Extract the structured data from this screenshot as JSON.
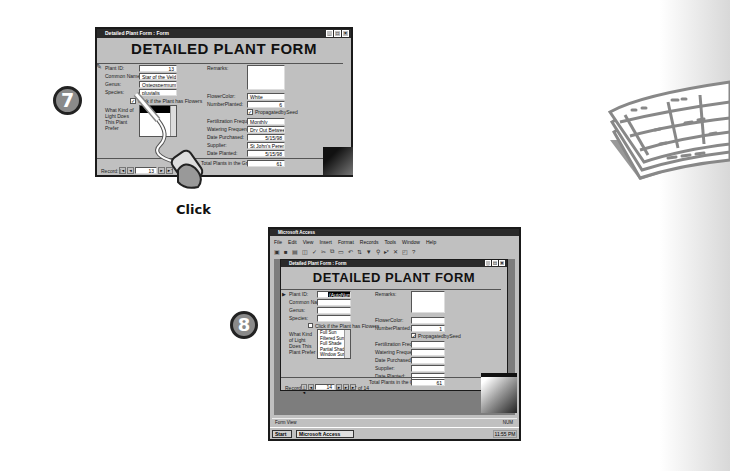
{
  "step7": {
    "badge": "7",
    "window": {
      "title": "Detailed Plant Form : Form",
      "form_title": "DETAILED PLANT FORM",
      "fields": {
        "plant_id": {
          "label": "Plant ID:",
          "value": "13"
        },
        "common_name": {
          "label": "Common Name:",
          "value": "Star of the Veldt"
        },
        "genus": {
          "label": "Genus:",
          "value": "Osteospermum"
        },
        "species": {
          "label": "Species:",
          "value": "pluvialis"
        },
        "flowers_checkbox": {
          "label": "Click if the Plant has Flowers",
          "checked": "✓"
        },
        "light": {
          "label": "What Kind of Light Does This Plant Prefer"
        },
        "remarks": {
          "label": "Remarks:",
          "value": ""
        },
        "flower_color": {
          "label": "FlowerColor:",
          "value": "White"
        },
        "number_planted": {
          "label": "NumberPlanted:",
          "value": "6"
        },
        "propagated": {
          "label": "PropagatedbySeed",
          "checked": "✓"
        },
        "fertilization": {
          "label": "Fertilization Frequency",
          "value": "Monthly"
        },
        "watering": {
          "label": "Watering Frequency",
          "value": "Dry Out Between W"
        },
        "date_purchased": {
          "label": "Date Purchased:",
          "value": "5/15/98"
        },
        "supplier": {
          "label": "Supplier:",
          "value": "St John's Perennia"
        },
        "date_planted": {
          "label": "Date Planted:",
          "value": "5/15/98"
        },
        "total_plants": {
          "label": "Total Plants in the Ground:",
          "value": "61"
        }
      },
      "record_nav": {
        "label": "Record:",
        "value": "13",
        "first": "|◄",
        "prev": "◄",
        "next": "►",
        "last": "►|",
        "new": "►*"
      }
    },
    "click_label": "Click"
  },
  "step8": {
    "badge": "8",
    "app_title": "Microsoft Access",
    "menu": [
      "File",
      "Edit",
      "View",
      "Insert",
      "Format",
      "Records",
      "Tools",
      "Window",
      "Help"
    ],
    "window": {
      "title": "Detailed Plant Form : Form",
      "form_title": "DETAILED PLANT FORM",
      "fields": {
        "plant_id": {
          "label": "Plant ID:",
          "value": "(AutoNumber)"
        },
        "common_name": {
          "label": "Common Name:",
          "value": ""
        },
        "genus": {
          "label": "Genus:",
          "value": ""
        },
        "species": {
          "label": "Species:",
          "value": ""
        },
        "flowers_checkbox": {
          "label": "Click if the Plant has Flowers"
        },
        "light": {
          "label": "What Kind of Light Does This Plant Prefer"
        },
        "light_options": [
          "Full Sun",
          "Filtered Sun",
          "Full Shade",
          "Partial Shade",
          "Window Sun"
        ],
        "remarks": {
          "label": "Remarks:",
          "value": ""
        },
        "flower_color": {
          "label": "FlowerColor:",
          "value": ""
        },
        "number_planted": {
          "label": "NumberPlanted:",
          "value": "1"
        },
        "propagated": {
          "label": "PropagatedbySeed",
          "checked": "✓"
        },
        "fertilization": {
          "label": "Fertilization Frequency",
          "value": ""
        },
        "watering": {
          "label": "Watering Frequency",
          "value": ""
        },
        "date_purchased": {
          "label": "Date Purchased:",
          "value": ""
        },
        "supplier": {
          "label": "Supplier:",
          "value": ""
        },
        "date_planted": {
          "label": "Date Planted:",
          "value": ""
        },
        "total_plants": {
          "label": "Total Plants in the Ground:",
          "value": "61"
        }
      },
      "record_nav": {
        "label": "Record:",
        "value": "14",
        "of": "of 14"
      }
    },
    "status": "Form View",
    "status_right": "NUM",
    "taskbar": {
      "start": "Start",
      "task": "Microsoft Access",
      "clock": "11:55 PM"
    }
  }
}
